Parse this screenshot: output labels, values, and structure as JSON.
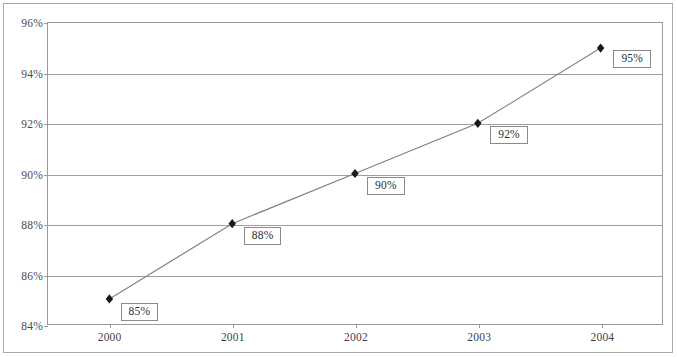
{
  "figure": {
    "border_color": "#a9a9a9",
    "background": "#ffffff"
  },
  "chart_data": {
    "type": "line",
    "title": "",
    "subtitle": "",
    "xlabel": "",
    "ylabel": "",
    "categories": [
      "2000",
      "2001",
      "2002",
      "2003",
      "2004"
    ],
    "values": [
      85,
      88,
      90,
      92,
      95
    ],
    "point_labels": [
      "85%",
      "88%",
      "90%",
      "92%",
      "95%"
    ],
    "ylim": [
      84,
      96
    ],
    "ytick_values": [
      84,
      86,
      88,
      90,
      92,
      94,
      96
    ],
    "ytick_labels": [
      "84%",
      "86%",
      "88%",
      "90%",
      "92%",
      "94%",
      "96%"
    ],
    "grid": true,
    "grid_axis": "y",
    "legend": false,
    "legend_position": "none",
    "marker": "diamond",
    "marker_color": "#1a1a1a",
    "line_color": "#808089",
    "gridline_color": "#9e9e9e",
    "axis_color": "#9a9a9a",
    "label_box_border": "#8a8a8a",
    "label_text_color": "#2e2e33",
    "tick_text_color": "#4a4a52"
  }
}
